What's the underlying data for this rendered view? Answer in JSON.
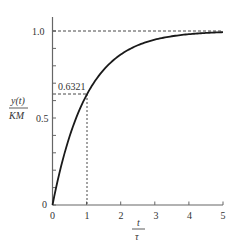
{
  "chart_data": {
    "type": "line",
    "title": "",
    "xlabel": "t/τ",
    "ylabel": "y(t)/KM",
    "xlabel_parts": {
      "numerator": "t",
      "denominator": "τ"
    },
    "ylabel_parts": {
      "numerator": "y(t)",
      "denominator": "KM"
    },
    "xlim": [
      0,
      5
    ],
    "ylim": [
      0,
      1.05
    ],
    "x_ticks": [
      0,
      1,
      2,
      3,
      4,
      5
    ],
    "x_tick_labels": [
      "0",
      "1",
      "2",
      "3",
      "4",
      "5"
    ],
    "y_ticks_labeled": [
      0,
      0.5,
      1.0
    ],
    "y_tick_labels": [
      "0",
      "0.5",
      "1.0"
    ],
    "y_minor_ticks": [
      0.1,
      0.2,
      0.3,
      0.4,
      0.6,
      0.7,
      0.8,
      0.9
    ],
    "grid": false,
    "legend": null,
    "series": [
      {
        "name": "first-order step response y(t)/KM = 1 - exp(-t/τ)",
        "x": [
          0,
          0.25,
          0.5,
          0.75,
          1,
          1.5,
          2,
          2.5,
          3,
          3.5,
          4,
          4.5,
          5
        ],
        "values": [
          0,
          0.2212,
          0.3935,
          0.5276,
          0.6321,
          0.7769,
          0.8647,
          0.9179,
          0.9502,
          0.9698,
          0.9817,
          0.9889,
          0.9933
        ]
      }
    ],
    "annotations": [
      {
        "text": "0.6321",
        "x": 1,
        "y": 0.6321,
        "note": "dashed guide lines to y-axis and x-axis"
      },
      {
        "text": "",
        "y": 1.0,
        "note": "dashed horizontal asymptote at 1.0"
      }
    ]
  },
  "labels": {
    "y_tick_0": "0",
    "y_tick_05": "0.5",
    "y_tick_10": "1.0",
    "x_tick_0": "0",
    "x_tick_1": "1",
    "x_tick_2": "2",
    "x_tick_3": "3",
    "x_tick_4": "4",
    "x_tick_5": "5",
    "annotation_value": "0.6321",
    "ylabel_num": "y(t)",
    "ylabel_den": "KM",
    "xlabel_num": "t",
    "xlabel_den": "τ"
  },
  "colors": {
    "axis": "#666666",
    "curve": "#1a1a1a",
    "dashed": "#333333",
    "text": "#333333"
  }
}
